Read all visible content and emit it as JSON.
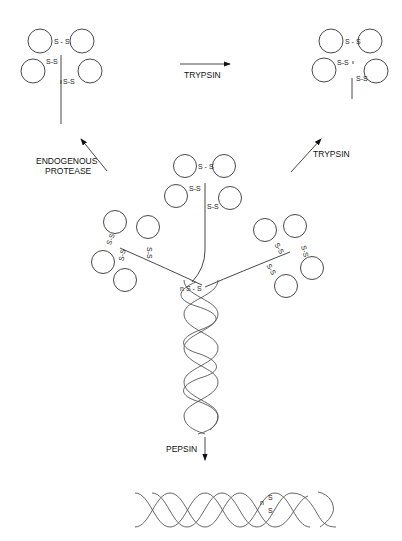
{
  "diagram": {
    "type": "protein-cleavage-schematic",
    "labels": {
      "trypsin_top": "TRYPSIN",
      "trypsin_right": "TRYPSIN",
      "endogenous_line1": "ENDOGENOUS",
      "endogenous_line2": "PROTEASE",
      "pepsin": "PEPSIN"
    },
    "disulfide": {
      "ss": "S - S",
      "ss_tight": "S-S",
      "s": "S",
      "n": "n"
    },
    "nodes": [
      {
        "id": "intact-molecule",
        "description": "Three globular heads with disulfide bridges joined to a triple-helical collagen-like stalk"
      },
      {
        "id": "endogenous-fragment",
        "description": "Single head cluster with long stalk, top-left"
      },
      {
        "id": "trypsin-fragment",
        "description": "Single head cluster with short stalk, top-right"
      },
      {
        "id": "pepsin-fragment",
        "description": "Helical stalk with disulfide at end, bottom"
      }
    ],
    "edges": [
      {
        "from": "intact-molecule",
        "to": "endogenous-fragment",
        "label": "ENDOGENOUS PROTEASE"
      },
      {
        "from": "intact-molecule",
        "to": "trypsin-fragment",
        "label": "TRYPSIN"
      },
      {
        "from": "endogenous-fragment",
        "to": "trypsin-fragment",
        "label": "TRYPSIN"
      },
      {
        "from": "intact-molecule",
        "to": "pepsin-fragment",
        "label": "PEPSIN"
      }
    ]
  }
}
